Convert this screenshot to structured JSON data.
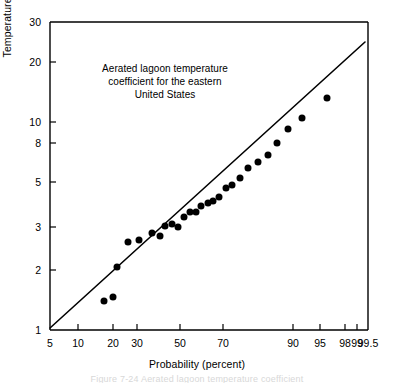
{
  "figure": {
    "annotation_lines": [
      "Aerated lagoon temperature",
      "coefficient for the eastern",
      "United States"
    ],
    "ylabel_main": "Temperature factor \"f\" x 10",
    "ylabel_exponent": "6",
    "xlabel": "Probability (percent)",
    "caption_partial": "Figure 7-24   Aerated lagoon temperature coefficient"
  },
  "chart_data": {
    "type": "scatter",
    "title": "",
    "subtitle": "",
    "annotation": "Aerated lagoon temperature coefficient for the eastern United States",
    "xlabel": "Probability (percent)",
    "ylabel": "Temperature factor \"f\" x 10^6",
    "x_scale": "probability",
    "y_scale": "log",
    "xlim": [
      5,
      99.5
    ],
    "ylim": [
      1,
      30
    ],
    "grid": false,
    "legend": null,
    "xticks": [
      5,
      10,
      20,
      30,
      50,
      70,
      90,
      95,
      98,
      99,
      99.5
    ],
    "xtick_labels": [
      "5",
      "10",
      "20",
      "30",
      "50",
      "70",
      "90",
      "95",
      "98",
      "99",
      "99.5"
    ],
    "xtick_px": [
      50,
      78,
      113,
      137,
      180,
      223,
      293,
      320,
      345,
      357,
      368
    ],
    "yticks": [
      1,
      2,
      3,
      5,
      8,
      10,
      20,
      30
    ],
    "ytick_labels": [
      "1",
      "2",
      "3",
      "5",
      "8",
      "10",
      "20",
      "30"
    ],
    "ytick_px": [
      330,
      270,
      227,
      182,
      143,
      122,
      62,
      22
    ],
    "series": [
      {
        "name": "Aerated lagoon temperature coefficient data",
        "marker": "filled-circle",
        "marker_color": "#000000",
        "marker_size_px": 7,
        "points_px": [
          [
            104,
            301
          ],
          [
            113,
            297
          ],
          [
            117,
            267
          ],
          [
            128,
            242
          ],
          [
            139,
            240
          ],
          [
            152,
            233
          ],
          [
            160,
            236
          ],
          [
            165,
            226
          ],
          [
            172,
            224
          ],
          [
            178,
            227
          ],
          [
            184,
            217
          ],
          [
            190,
            212
          ],
          [
            196,
            212
          ],
          [
            201,
            206
          ],
          [
            208,
            203
          ],
          [
            213,
            201
          ],
          [
            219,
            197
          ],
          [
            226,
            188
          ],
          [
            232,
            185
          ],
          [
            240,
            178
          ],
          [
            248,
            168
          ],
          [
            258,
            162
          ],
          [
            268,
            155
          ],
          [
            277,
            143
          ],
          [
            288,
            129
          ],
          [
            302,
            118
          ],
          [
            327,
            98
          ]
        ],
        "values": [
          {
            "probability": 19.5,
            "f": 1.48
          },
          {
            "probability": 22.4,
            "f": 1.54
          },
          {
            "probability": 23.7,
            "f": 1.93
          },
          {
            "probability": 27.3,
            "f": 2.32
          },
          {
            "probability": 31.0,
            "f": 2.36
          },
          {
            "probability": 35.3,
            "f": 2.5
          },
          {
            "probability": 38.0,
            "f": 2.44
          },
          {
            "probability": 39.7,
            "f": 2.65
          },
          {
            "probability": 42.0,
            "f": 2.7
          },
          {
            "probability": 44.0,
            "f": 2.63
          },
          {
            "probability": 46.0,
            "f": 2.87
          },
          {
            "probability": 48.0,
            "f": 2.99
          },
          {
            "probability": 50.0,
            "f": 2.99
          },
          {
            "probability": 51.7,
            "f": 3.15
          },
          {
            "probability": 54.0,
            "f": 3.23
          },
          {
            "probability": 55.7,
            "f": 3.28
          },
          {
            "probability": 57.7,
            "f": 3.4
          },
          {
            "probability": 60.0,
            "f": 3.68
          },
          {
            "probability": 62.0,
            "f": 3.79
          },
          {
            "probability": 64.7,
            "f": 4.05
          },
          {
            "probability": 67.3,
            "f": 4.47
          },
          {
            "probability": 70.7,
            "f": 4.75
          },
          {
            "probability": 74.0,
            "f": 5.1
          },
          {
            "probability": 77.0,
            "f": 5.78
          },
          {
            "probability": 80.7,
            "f": 6.73
          },
          {
            "probability": 85.3,
            "f": 7.65
          },
          {
            "probability": 93.4,
            "f": 9.9
          }
        ]
      },
      {
        "name": "fitted line",
        "type": "line",
        "color": "#000000",
        "width_px": 1.6,
        "endpoints_px": [
          [
            50,
            328
          ],
          [
            365,
            42
          ]
        ],
        "endpoints_data": [
          {
            "probability": 5,
            "f": 1.02
          },
          {
            "probability": 99.2,
            "f": 21.5
          }
        ]
      }
    ]
  }
}
